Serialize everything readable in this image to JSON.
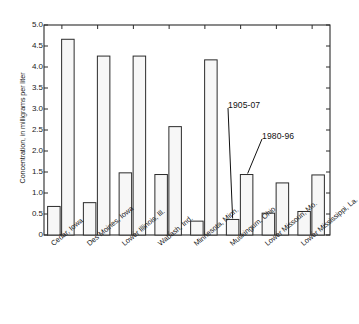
{
  "chart_data": {
    "type": "bar",
    "title": "",
    "xlabel": "",
    "ylabel": "Concentration, in milligrams per liter",
    "ylim": [
      0,
      5.0
    ],
    "yticks": [
      "5.0",
      "4.5",
      "4.0",
      "3.5",
      "3.0",
      "2.5",
      "2.0",
      "1.5",
      "1.0",
      "0.5",
      "0"
    ],
    "ytick_values": [
      5.0,
      4.5,
      4.0,
      3.5,
      3.0,
      2.5,
      2.0,
      1.5,
      1.0,
      0.5,
      0
    ],
    "grid": false,
    "legend_position": "annotations-inline",
    "categories": [
      "Cedar, Iowa",
      "Des Moines, Iowa",
      "Lower Illinois, Ill.",
      "Wabash, Ind.",
      "Minnesota, Minn.",
      "Muskingum, Ohio",
      "Lower Missouri, Mo.",
      "Lower Mississippi, La."
    ],
    "series": [
      {
        "name": "1905-07",
        "values": [
          0.68,
          0.77,
          1.48,
          1.44,
          0.33,
          0.37,
          0.52,
          0.56
        ]
      },
      {
        "name": "1980-96",
        "values": [
          4.66,
          4.26,
          4.26,
          2.58,
          4.17,
          1.44,
          1.24,
          1.43
        ]
      }
    ],
    "annotations": [
      {
        "text": "1905-07",
        "points_to_series": "1905-07",
        "points_to_category": "Muskingum, Ohio"
      },
      {
        "text": "1980-96",
        "points_to_series": "1980-96",
        "points_to_category": "Muskingum, Ohio"
      }
    ],
    "bar_fill_color": "#f7f7f7",
    "bar_edge_color": "#2b2b2b",
    "axis_color": "#2b2b2b",
    "background_color": "#ffffff"
  }
}
